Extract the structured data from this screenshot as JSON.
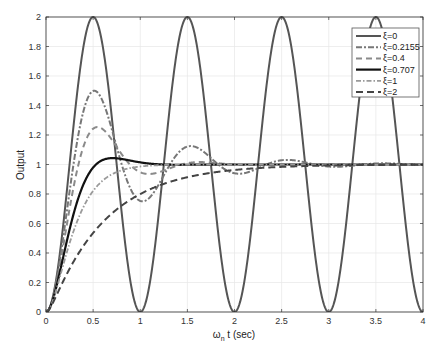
{
  "chart_data": {
    "type": "line",
    "title": "",
    "xlabel": "ω_n t (sec)",
    "xlabel_main": "ω",
    "xlabel_sub": "n",
    "xlabel_rest": " t (sec)",
    "ylabel": "Output",
    "xlim": [
      0,
      4
    ],
    "ylim": [
      0,
      2
    ],
    "x_ticks": [
      0,
      0.5,
      1,
      1.5,
      2,
      2.5,
      3,
      3.5,
      4
    ],
    "x_tick_labels": [
      "0",
      "0.5",
      "1",
      "1.5",
      "2",
      "2.5",
      "3",
      "3.5",
      "4"
    ],
    "y_ticks": [
      0,
      0.2,
      0.4,
      0.6,
      0.8,
      1,
      1.2,
      1.4,
      1.6,
      1.8,
      2
    ],
    "y_tick_labels": [
      "0",
      "0.2",
      "0.4",
      "0.6",
      "0.8",
      "1",
      "1.2",
      "1.4",
      "1.6",
      "1.8",
      "2"
    ],
    "grid": true,
    "legend_position": "upper right",
    "x_scale_note": "time axis in units where natural frequency corresponds to one cycle per unit (wn = 2π)",
    "series": [
      {
        "name": "ξ=0",
        "zeta": 0,
        "color": "#555555",
        "width": 2,
        "dash": ""
      },
      {
        "name": "ξ=0.2155",
        "zeta": 0.2155,
        "color": "#777777",
        "width": 2,
        "dash": "6,2,2,2"
      },
      {
        "name": "ξ=0.4",
        "zeta": 0.4,
        "color": "#8a8a8a",
        "width": 2,
        "dash": "6,4"
      },
      {
        "name": "ξ=0.707",
        "zeta": 0.707,
        "color": "#111111",
        "width": 2.2,
        "dash": ""
      },
      {
        "name": "ξ=1",
        "zeta": 1,
        "color": "#9a9a9a",
        "width": 1.8,
        "dash": "5,2,1.5,2"
      },
      {
        "name": "ξ=2",
        "zeta": 2,
        "color": "#444444",
        "width": 2,
        "dash": "7,4"
      }
    ],
    "sample_values": {
      "ξ=0": {
        "x": [
          0,
          0.25,
          0.5,
          0.75,
          1,
          1.5,
          2,
          2.5,
          3,
          3.5,
          4
        ],
        "y": [
          0,
          1,
          2,
          1,
          0,
          2,
          0,
          2,
          0,
          2,
          0
        ]
      },
      "ξ=0.2155": {
        "x": [
          0,
          0.25,
          0.5,
          1,
          1.5,
          2,
          2.5,
          3,
          4
        ],
        "y": [
          0,
          0.85,
          1.5,
          0.75,
          1.1,
          0.96,
          1.03,
          0.99,
          1.0
        ]
      },
      "ξ=0.4": {
        "x": [
          0,
          0.25,
          0.5,
          1,
          1.5,
          2,
          3,
          4
        ],
        "y": [
          0,
          0.75,
          1.25,
          0.94,
          1.01,
          1.0,
          1.0,
          1.0
        ]
      },
      "ξ=0.707": {
        "x": [
          0,
          0.25,
          0.5,
          0.7,
          1,
          1.5,
          2,
          4
        ],
        "y": [
          0,
          0.6,
          1.0,
          1.04,
          1.01,
          1.0,
          1.0,
          1.0
        ]
      },
      "ξ=1": {
        "x": [
          0,
          0.25,
          0.5,
          1,
          1.5,
          2,
          4
        ],
        "y": [
          0,
          0.46,
          0.82,
          0.98,
          1.0,
          1.0,
          1.0
        ]
      },
      "ξ=2": {
        "x": [
          0,
          0.25,
          0.5,
          1,
          1.5,
          2,
          2.5,
          3,
          4
        ],
        "y": [
          0,
          0.2,
          0.45,
          0.76,
          0.9,
          0.96,
          0.98,
          0.99,
          1.0
        ]
      }
    }
  }
}
